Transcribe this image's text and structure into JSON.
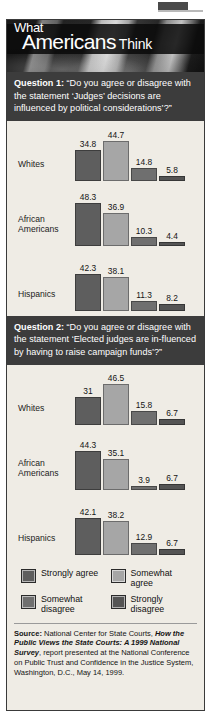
{
  "header": {
    "title_line1": "What",
    "title_line2a": "Americans",
    "title_line2b": "Think"
  },
  "questions": [
    {
      "prefix": "Question 1:",
      "text": " “Do you agree or disagree with the statement ‘Judges’ decisions are influenced by political considerations’?”"
    },
    {
      "prefix": "Question 2:",
      "text": " “Do you agree or disagree with the statement ‘Elected judges are in-fluenced by having to raise campaign funds’?”"
    }
  ],
  "legend": [
    {
      "label": "Strongly agree",
      "color": "#5e5e5e"
    },
    {
      "label": "Somewhat agree",
      "color": "#a6a6a6"
    },
    {
      "label": "Somewhat disagree",
      "color": "#6f6f6f"
    },
    {
      "label": "Strongly disagree",
      "color": "#545454"
    }
  ],
  "source": {
    "prefix": "Source:",
    "part1": " National Center for State Courts, ",
    "italic": "How the Public Views the State Courts: A 1999 National Survey",
    "part2": ", report presented at the National Conference on Public Trust and Confidence in the Justice System, Washington, D.C., May 14, 1999."
  },
  "chart_data": [
    {
      "type": "bar",
      "title": "Question 1: “Do you agree or disagree with the statement ‘Judges’ decisions are influenced by political considerations’?”",
      "xlabel": "",
      "ylabel": "Percent",
      "ylim": [
        0,
        50
      ],
      "grid": false,
      "legend_position": "bottom",
      "categories": [
        "Whites",
        "African Americans",
        "Hispanics"
      ],
      "series": [
        {
          "name": "Strongly agree",
          "values": [
            34.8,
            48.3,
            42.3
          ]
        },
        {
          "name": "Somewhat agree",
          "values": [
            44.7,
            36.9,
            38.1
          ]
        },
        {
          "name": "Somewhat disagree",
          "values": [
            14.8,
            10.3,
            11.3
          ]
        },
        {
          "name": "Strongly disagree",
          "values": [
            5.8,
            4.4,
            8.2
          ]
        }
      ],
      "labels": [
        [
          "34.8",
          "44.7",
          "14.8",
          "5.8"
        ],
        [
          "48.3",
          "36.9",
          "10.3",
          "4.4"
        ],
        [
          "42.3",
          "38.1",
          "11.3",
          "8.2"
        ]
      ]
    },
    {
      "type": "bar",
      "title": "Question 2: “Do you agree or disagree with the statement ‘Elected judges are influenced by having to raise campaign funds’?”",
      "xlabel": "",
      "ylabel": "Percent",
      "ylim": [
        0,
        50
      ],
      "grid": false,
      "legend_position": "bottom",
      "categories": [
        "Whites",
        "African Americans",
        "Hispanics"
      ],
      "series": [
        {
          "name": "Strongly agree",
          "values": [
            31,
            44.3,
            42.1
          ]
        },
        {
          "name": "Somewhat agree",
          "values": [
            46.5,
            35.1,
            38.2
          ]
        },
        {
          "name": "Somewhat disagree",
          "values": [
            15.8,
            3.9,
            12.9
          ]
        },
        {
          "name": "Strongly disagree",
          "values": [
            6.7,
            6.7,
            6.7
          ]
        }
      ],
      "labels": [
        [
          "31",
          "46.5",
          "15.8",
          "6.7"
        ],
        [
          "44.3",
          "35.1",
          "3.9",
          "6.7"
        ],
        [
          "42.1",
          "38.2",
          "12.9",
          "6.7"
        ]
      ]
    }
  ]
}
